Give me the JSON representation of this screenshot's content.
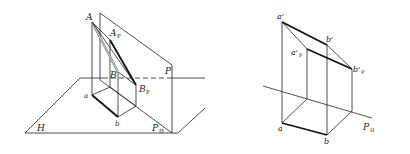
{
  "figures": [
    {
      "name": "pictorial-view",
      "labels": {
        "A": "A",
        "A_P": "A",
        "A_P_sub": "P",
        "B": "B",
        "B_P": "B",
        "B_P_sub": "P",
        "P": "P",
        "a": "a",
        "b": "b",
        "H": "H",
        "P_H": "P",
        "P_H_sub": "H"
      }
    },
    {
      "name": "orthographic-view",
      "labels": {
        "a_prime": "a'",
        "b_prime": "b'",
        "a_prime_P": "a'",
        "a_prime_P_sub": "P",
        "b_prime_P": "b'",
        "b_prime_P_sub": "P",
        "a": "a",
        "b": "b",
        "P_H": "P",
        "P_H_sub": "H"
      }
    }
  ],
  "colors": {
    "line": "#222222",
    "thick": "#111111",
    "gray": "#777777"
  }
}
